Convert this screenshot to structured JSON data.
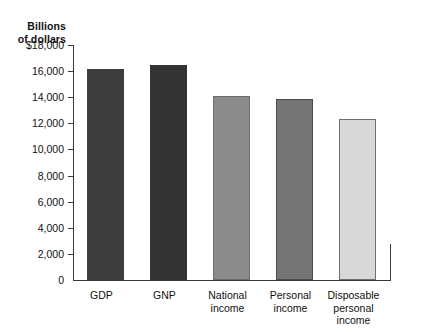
{
  "chart_data": {
    "type": "bar",
    "title": "",
    "ylabel": "Billions\nof dollars",
    "xlabel": "",
    "ylim": [
      0,
      18000
    ],
    "ytick_step": 2000,
    "grid": false,
    "legend": "none",
    "ytick_labels": [
      "$18,000",
      "16,000",
      "14,000",
      "12,000",
      "10,000",
      "8,000",
      "6,000",
      "4,000",
      "2,000",
      "0"
    ],
    "ytick_values": [
      18000,
      16000,
      14000,
      12000,
      10000,
      8000,
      6000,
      4000,
      2000,
      0
    ],
    "categories": [
      "GDP",
      "GNP",
      "National\nincome",
      "Personal\nincome",
      "Disposable\npersonal\nincome"
    ],
    "values": [
      16200,
      16500,
      14100,
      13900,
      12300
    ],
    "bar_colors": [
      "#3d3d3d",
      "#333333",
      "#8c8c8c",
      "#757575",
      "#d8d8d8"
    ],
    "axis_color": "#3a3a3a",
    "background": "#ffffff"
  }
}
